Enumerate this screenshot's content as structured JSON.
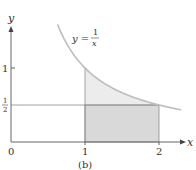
{
  "figure": {
    "caption": "(b)",
    "function_label": {
      "lhs": "y =",
      "numerator": "1",
      "denominator": "x"
    },
    "x_axis_label": "x",
    "y_axis_label": "y",
    "origin_label": "0",
    "x_ticks": [
      {
        "value": 1,
        "label": "1"
      },
      {
        "value": 2,
        "label": "2"
      }
    ],
    "y_ticks": [
      {
        "value": 1,
        "label": "1"
      },
      {
        "value": 0.5,
        "label_num": "1",
        "label_den": "2"
      }
    ],
    "curve": {
      "function": "1/x",
      "x_from": 0.63,
      "x_to": 2.3
    },
    "regions": [
      {
        "name": "area-under-curve",
        "x_from": 1,
        "x_to": 2,
        "under": "1/x",
        "color": "#ececec"
      },
      {
        "name": "rectangle",
        "x_from": 1,
        "x_to": 2,
        "y_from": 0,
        "y_to": 0.5,
        "color": "#d9d9d9"
      }
    ],
    "horizontal_line": {
      "y": 0.5
    },
    "colors": {
      "axis": "#666666",
      "curve": "#bdbdbd",
      "edge": "#8a8a8a"
    }
  }
}
